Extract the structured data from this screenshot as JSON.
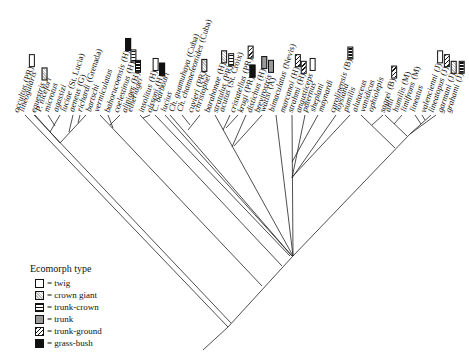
{
  "legend": {
    "title": "Ecomorph type",
    "items": [
      {
        "key": "twig",
        "label": "= twig"
      },
      {
        "key": "crown-giant",
        "label": "= crown giant"
      },
      {
        "key": "trunk-crown",
        "label": "= trunk-crown"
      },
      {
        "key": "trunk",
        "label": "= trunk"
      },
      {
        "key": "trunk-ground",
        "label": "= trunk-ground"
      },
      {
        "key": "grass-bush",
        "label": "= grass-bush"
      }
    ]
  },
  "tips": [
    {
      "name": "occultus",
      "loc": "(PR)",
      "eco": "twig"
    },
    {
      "name": "lineogularis",
      "loc": "",
      "eco": ""
    },
    {
      "name": "equestris",
      "loc": "",
      "eco": "crown-giant"
    },
    {
      "name": "P. nicefori",
      "loc": "",
      "eco": ""
    },
    {
      "name": "microtus",
      "loc": "",
      "eco": ""
    },
    {
      "name": "agassizi",
      "loc": "",
      "eco": ""
    },
    {
      "name": "luciae",
      "loc": "(St. Lucia)",
      "eco": ""
    },
    {
      "name": "aeneus",
      "loc": "(G)",
      "eco": ""
    },
    {
      "name": "richardi",
      "loc": "(Grenada)",
      "eco": ""
    },
    {
      "name": "bartschi",
      "loc": "",
      "eco": ""
    },
    {
      "name": "vermiculatus",
      "loc": "",
      "eco": ""
    },
    {
      "name": "bahorucoensis",
      "loc": "(H)",
      "eco": "grass-bush"
    },
    {
      "name": "coelestinus",
      "loc": "(H)",
      "eco": "trunk-crown"
    },
    {
      "name": "aliniger",
      "loc": "(H)",
      "eco": "trunk-crown"
    },
    {
      "name": "etheridgei",
      "loc": "",
      "eco": ""
    },
    {
      "name": "insolitus",
      "loc": "(H)",
      "eco": "twig"
    },
    {
      "name": "olssoni",
      "loc": "(H)",
      "eco": "grass-bush"
    },
    {
      "name": "C. barbouri",
      "loc": "",
      "eco": ""
    },
    {
      "name": "lucius",
      "loc": "",
      "eco": ""
    },
    {
      "name": "Ch. guamuhaya",
      "loc": "(Cuba)",
      "eco": ""
    },
    {
      "name": "Ch. chamaeleonides",
      "loc": "(Cuba)",
      "eco": ""
    },
    {
      "name": "cuvieri",
      "loc": "(PR)",
      "eco": "crown-giant"
    },
    {
      "name": "christophei",
      "loc": "",
      "eco": ""
    },
    {
      "name": "barahonae",
      "loc": "(H)",
      "eco": "crown-giant"
    },
    {
      "name": "stratulus",
      "loc": "(PR)",
      "eco": "trunk-crown"
    },
    {
      "name": "acutus",
      "loc": "(St. Croix)",
      "eco": ""
    },
    {
      "name": "cristatellus",
      "loc": "(PR)",
      "eco": "trunk-ground"
    },
    {
      "name": "krugi",
      "loc": "(PR)",
      "eco": "grass-bush"
    },
    {
      "name": "distichus",
      "loc": "(H)",
      "eco": "trunk"
    },
    {
      "name": "brevirostris",
      "loc": "",
      "eco": "trunk"
    },
    {
      "name": "wattsi",
      "loc": "(A)",
      "eco": ""
    },
    {
      "name": "bimaculatus",
      "loc": "(Nevis)",
      "eco": ""
    },
    {
      "name": "marcanoi",
      "loc": "(H)",
      "eco": "trunk-ground"
    },
    {
      "name": "strahmi",
      "loc": "(H)",
      "eco": "trunk-ground"
    },
    {
      "name": "angusticeps",
      "loc": "",
      "eco": "twig"
    },
    {
      "name": "paternus",
      "loc": "",
      "eco": ""
    },
    {
      "name": "sheplani",
      "loc": "",
      "eco": ""
    },
    {
      "name": "maynardi",
      "loc": "",
      "eco": ""
    },
    {
      "name": "carolinensis",
      "loc": "(B)",
      "eco": "trunk-crown"
    },
    {
      "name": "loysiana",
      "loc": "",
      "eco": ""
    },
    {
      "name": "pumilis",
      "loc": "",
      "eco": ""
    },
    {
      "name": "alutaceus",
      "loc": "",
      "eco": ""
    },
    {
      "name": "vanidicus",
      "loc": "",
      "eco": ""
    },
    {
      "name": "ophiolepis",
      "loc": "",
      "eco": ""
    },
    {
      "name": "sagrei",
      "loc": "(B)",
      "eco": "trunk-ground"
    },
    {
      "name": "ahli",
      "loc": "",
      "eco": ""
    },
    {
      "name": "humilis",
      "loc": "(M)",
      "eco": ""
    },
    {
      "name": "limifrons",
      "loc": "(M)",
      "eco": ""
    },
    {
      "name": "lineatus",
      "loc": "",
      "eco": ""
    },
    {
      "name": "valencienni",
      "loc": "(J)",
      "eco": "twig"
    },
    {
      "name": "lineatopus",
      "loc": "(J)",
      "eco": "trunk-ground"
    },
    {
      "name": "garmani",
      "loc": "(J)",
      "eco": "crown-giant"
    },
    {
      "name": "grahami",
      "loc": "(J)",
      "eco": "trunk-crown"
    }
  ]
}
